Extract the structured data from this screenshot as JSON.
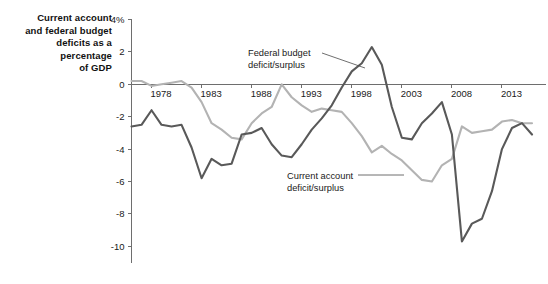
{
  "title": {
    "lines": [
      "Current account",
      "and federal budget",
      "deficits as a",
      "percentage",
      "of GDP"
    ],
    "full": "Current account and federal budget deficits as a percentage of GDP"
  },
  "annotations": {
    "federal": {
      "line1": "Federal budget",
      "line2": "deficit/surplus"
    },
    "current": {
      "line1": "Current account",
      "line2": "deficit/surplus"
    }
  },
  "colors": {
    "federal_budget": "#595959",
    "current_account": "#b3b3b3",
    "axis": "#6e6e6e",
    "text": "#1a1a1a",
    "background": "#ffffff"
  },
  "chart_data": {
    "type": "line",
    "title": "Current account and federal budget deficits as a percentage of GDP",
    "xlabel": "",
    "ylabel": "",
    "xlim": [
      1976,
      2016
    ],
    "ylim": [
      -11,
      4
    ],
    "grid": false,
    "legend": "inline-annotations",
    "ytick_labels": [
      "4%",
      "2",
      "0",
      "-2",
      "-4",
      "-6",
      "-8",
      "-10"
    ],
    "ytick_values": [
      4,
      2,
      0,
      -2,
      -4,
      -6,
      -8,
      -10
    ],
    "xtick_labels": [
      "1978",
      "1983",
      "1988",
      "1993",
      "1998",
      "2003",
      "2008",
      "2013"
    ],
    "xtick_values": [
      1978,
      1983,
      1988,
      1993,
      1998,
      2003,
      2008,
      2013
    ],
    "x": [
      1976,
      1977,
      1978,
      1979,
      1980,
      1981,
      1982,
      1983,
      1984,
      1985,
      1986,
      1987,
      1988,
      1989,
      1990,
      1991,
      1992,
      1993,
      1994,
      1995,
      1996,
      1997,
      1998,
      1999,
      2000,
      2001,
      2002,
      2003,
      2004,
      2005,
      2006,
      2007,
      2008,
      2009,
      2010,
      2011,
      2012,
      2013,
      2014,
      2015,
      2016
    ],
    "series": [
      {
        "name": "Federal budget deficit/surplus",
        "color": "#595959",
        "values": [
          -2.6,
          -2.5,
          -1.6,
          -2.5,
          -2.6,
          -2.5,
          -3.9,
          -5.8,
          -4.6,
          -5.0,
          -4.9,
          -3.1,
          -3.0,
          -2.7,
          -3.7,
          -4.4,
          -4.5,
          -3.7,
          -2.8,
          -2.1,
          -1.3,
          -0.2,
          0.8,
          1.3,
          2.3,
          1.2,
          -1.4,
          -3.3,
          -3.4,
          -2.4,
          -1.8,
          -1.1,
          -3.1,
          -9.7,
          -8.6,
          -8.3,
          -6.6,
          -4.0,
          -2.7,
          -2.4,
          -3.1
        ]
      },
      {
        "name": "Current account deficit/surplus",
        "color": "#b3b3b3",
        "values": [
          0.2,
          0.2,
          -0.1,
          0.0,
          0.1,
          0.2,
          -0.2,
          -1.1,
          -2.4,
          -2.8,
          -3.3,
          -3.4,
          -2.4,
          -1.8,
          -1.4,
          0.0,
          -0.8,
          -1.3,
          -1.7,
          -1.5,
          -1.6,
          -1.7,
          -2.4,
          -3.2,
          -4.2,
          -3.8,
          -4.3,
          -4.7,
          -5.3,
          -5.9,
          -6.0,
          -5.0,
          -4.6,
          -2.6,
          -3.0,
          -2.9,
          -2.8,
          -2.3,
          -2.2,
          -2.4,
          -2.4
        ]
      }
    ]
  }
}
